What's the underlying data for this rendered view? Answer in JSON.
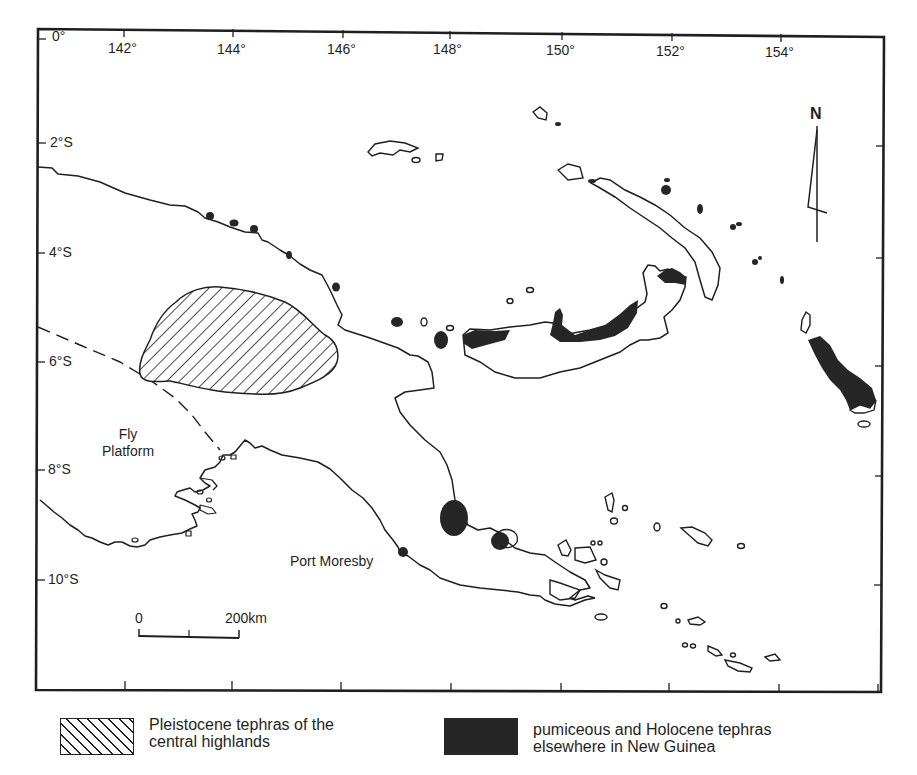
{
  "map": {
    "frame": {
      "left": 38,
      "top": 29,
      "right": 884,
      "bottom": 692
    },
    "longitude_ticks": [
      {
        "label": "0°",
        "x": 52,
        "y": 28,
        "kind": "corner"
      },
      {
        "label": "142°",
        "x": 108,
        "y": 41
      },
      {
        "label": "144°",
        "x": 217,
        "y": 41
      },
      {
        "label": "146°",
        "x": 327,
        "y": 41
      },
      {
        "label": "148°",
        "x": 433,
        "y": 41
      },
      {
        "label": "150°",
        "x": 546,
        "y": 41
      },
      {
        "label": "152°",
        "x": 656,
        "y": 41
      },
      {
        "label": "154°",
        "x": 765,
        "y": 43
      }
    ],
    "latitude_ticks": [
      {
        "label": "2°S",
        "y": 137
      },
      {
        "label": "4°S",
        "y": 247
      },
      {
        "label": "6°S",
        "y": 355
      },
      {
        "label": "8°S",
        "y": 463
      },
      {
        "label": "10°S",
        "y": 573
      }
    ],
    "labels": {
      "fly_platform": [
        "Fly",
        "Platform"
      ],
      "port_moresby": "Port Moresby",
      "north": "N"
    },
    "scale_bar": {
      "start_label": "0",
      "end_label": "200km"
    },
    "colors": {
      "ink": "#1f1f1f",
      "fill_dark": "#262626",
      "background": "#ffffff"
    }
  },
  "legend": {
    "items": [
      {
        "symbol": "hatched",
        "line1": "Pleistocene tephras of the",
        "line2": "central highlands"
      },
      {
        "symbol": "solid-black",
        "line1": "pumiceous and Holocene tephras",
        "line2": "elsewhere in New Guinea"
      }
    ]
  }
}
